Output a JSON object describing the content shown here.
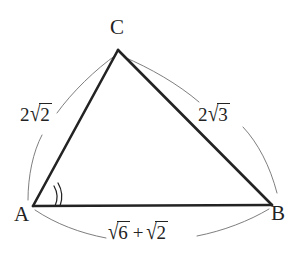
{
  "figure": {
    "kind": "triangle-geometry-diagram",
    "background_color": "#ffffff",
    "stroke_color": "#232323",
    "leader_arc_color": "#6f6f6f",
    "vertices": [
      {
        "name": "A",
        "label": "A",
        "x": 33,
        "y": 206
      },
      {
        "name": "B",
        "label": "B",
        "x": 272,
        "y": 205
      },
      {
        "name": "C",
        "label": "C",
        "x": 118,
        "y": 50
      }
    ],
    "sides": [
      {
        "name": "side-ac",
        "from": "A",
        "to": "C",
        "label_coefficient": "2",
        "label_surd": "√",
        "label_radicand": "2",
        "label_plain": "2√2"
      },
      {
        "name": "side-cb",
        "from": "C",
        "to": "B",
        "label_coefficient": "2",
        "label_surd": "√",
        "label_radicand": "3",
        "label_plain": "2√3"
      },
      {
        "name": "side-ab",
        "from": "A",
        "to": "B",
        "label_surd": "√",
        "label_radicand_first": "6",
        "label_operator": "+",
        "label_radicand_second": "2",
        "label_plain": "√6 + √2"
      }
    ],
    "angle_marks": [
      {
        "name": "angle-mark-a",
        "at_vertex": "A",
        "arc_count": 2,
        "radii": [
          22,
          27
        ]
      }
    ]
  }
}
